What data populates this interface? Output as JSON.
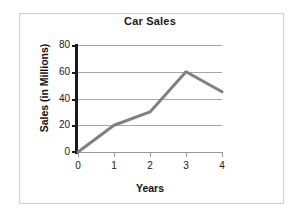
{
  "chart_data": {
    "type": "line",
    "title": "Car Sales",
    "xlabel": "Years",
    "ylabel": "Sales (in Millions)",
    "x": [
      0,
      1,
      2,
      3,
      4
    ],
    "values": [
      0,
      20,
      30,
      60,
      45
    ],
    "series": [
      {
        "name": "Car Sales",
        "values": [
          0,
          20,
          30,
          60,
          45
        ]
      }
    ],
    "xticks": [
      "0",
      "1",
      "2",
      "3",
      "4"
    ],
    "yticks": [
      "0",
      "20",
      "40",
      "60",
      "80"
    ],
    "xlim": [
      0,
      4
    ],
    "ylim": [
      0,
      80
    ],
    "grid": "horizontal",
    "legend": "none",
    "line_color": "#808080",
    "gridline_color": "#a6a6a6",
    "axis_color": "#1a1a1a",
    "background_color": "#ffffff",
    "frame_color": "#cfcfcf"
  },
  "labels": {
    "title": "Car Sales",
    "x_axis_title": "Years",
    "y_axis_title": "Sales (in Millions)"
  }
}
